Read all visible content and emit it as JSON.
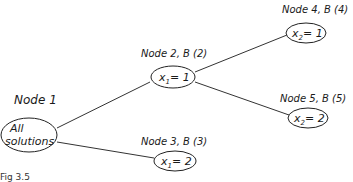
{
  "diagram": {
    "type": "branch-and-bound tree",
    "nodes": [
      {
        "id": "node1",
        "title": "Node 1",
        "content_line1": "All",
        "content_line2": "solutions"
      },
      {
        "id": "node2",
        "title": "Node 2, B (2)",
        "content_var": "x",
        "content_sub": "1",
        "content_val": "= 1"
      },
      {
        "id": "node3",
        "title": "Node 3, B (3)",
        "content_var": "x",
        "content_sub": "1",
        "content_val": "= 2"
      },
      {
        "id": "node4",
        "title": "Node 4, B (4)",
        "content_var": "x",
        "content_sub": "2",
        "content_val": "= 1"
      },
      {
        "id": "node5",
        "title": "Node 5, B (5)",
        "content_var": "x",
        "content_sub": "2",
        "content_val": "= 2"
      }
    ],
    "edges": [
      {
        "from": "node1",
        "to": "node2"
      },
      {
        "from": "node1",
        "to": "node3"
      },
      {
        "from": "node2",
        "to": "node4"
      },
      {
        "from": "node2",
        "to": "node5"
      }
    ],
    "caption": "Fig 3.5"
  }
}
